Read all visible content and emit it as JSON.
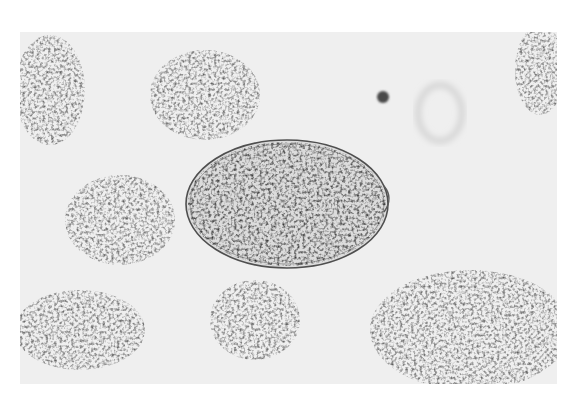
{
  "image": {
    "subject": "micrograph of an oval egg with operculum-like knob among granular debris",
    "style": "grayscale light micrograph",
    "background_color": "#efefef",
    "border_color": "#ffffff"
  },
  "objects": [
    {
      "name": "oval-egg",
      "cx": 287,
      "cy": 204,
      "rx": 101,
      "ry": 64,
      "shell_color": "#555555",
      "fill_color": "#d8d8d8"
    },
    {
      "name": "egg-knob",
      "cx": 385,
      "cy": 198
    },
    {
      "name": "dark-spot",
      "cx": 383,
      "cy": 97,
      "r": 6,
      "color": "#444444"
    },
    {
      "name": "faint-cell",
      "cx": 440,
      "cy": 113,
      "rx": 22,
      "ry": 28
    }
  ],
  "debris_clusters": [
    {
      "cx": 205,
      "cy": 95,
      "rx": 55,
      "ry": 45
    },
    {
      "cx": 50,
      "cy": 90,
      "rx": 35,
      "ry": 55
    },
    {
      "cx": 120,
      "cy": 220,
      "rx": 55,
      "ry": 45
    },
    {
      "cx": 80,
      "cy": 330,
      "rx": 65,
      "ry": 40
    },
    {
      "cx": 255,
      "cy": 320,
      "rx": 45,
      "ry": 40
    },
    {
      "cx": 470,
      "cy": 330,
      "rx": 100,
      "ry": 60
    },
    {
      "cx": 540,
      "cy": 70,
      "rx": 25,
      "ry": 45
    }
  ]
}
